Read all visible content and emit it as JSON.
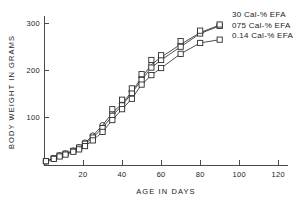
{
  "chart_data": {
    "type": "line",
    "title": "",
    "xlabel": "AGE IN DAYS",
    "ylabel": "BODY WEIGHT IN GRAMS",
    "xlim": [
      0,
      125
    ],
    "ylim": [
      0,
      315
    ],
    "xticks": [
      20,
      40,
      60,
      80,
      100,
      120
    ],
    "yticks": [
      100,
      200,
      300
    ],
    "grid": false,
    "legend_position": "top-right",
    "series": [
      {
        "name": "30 Cal-% EFA",
        "marker": "circle",
        "x": [
          1,
          5,
          8,
          11,
          15,
          18,
          21,
          25,
          30,
          35,
          40,
          45,
          50,
          55,
          60,
          70,
          80,
          90
        ],
        "y": [
          8,
          14,
          20,
          24,
          30,
          37,
          47,
          62,
          84,
          110,
          130,
          155,
          185,
          212,
          228,
          255,
          280,
          296
        ]
      },
      {
        "name": "075 Cal-% EFA",
        "marker": "square",
        "x": [
          1,
          5,
          8,
          11,
          15,
          18,
          21,
          25,
          30,
          35,
          40,
          45,
          50,
          55,
          60,
          70,
          80,
          90
        ],
        "y": [
          8,
          14,
          20,
          24,
          30,
          37,
          45,
          58,
          78,
          104,
          126,
          152,
          180,
          206,
          222,
          250,
          278,
          294
        ]
      },
      {
        "name": "0.14 Cal-% EFA",
        "marker": "square",
        "x": [
          1,
          5,
          8,
          11,
          15,
          18,
          21,
          25,
          30,
          35,
          40,
          45,
          50,
          55,
          60,
          70,
          80,
          90
        ],
        "y": [
          8,
          13,
          18,
          22,
          28,
          33,
          40,
          52,
          70,
          95,
          118,
          140,
          170,
          190,
          205,
          235,
          258,
          265
        ]
      }
    ],
    "overlay_series": [
      {
        "name": "30 Cal-% EFA upper squares",
        "marker": "square",
        "x": [
          35,
          40,
          45,
          50,
          55,
          60,
          70,
          80,
          90
        ],
        "y": [
          118,
          138,
          162,
          192,
          222,
          232,
          262,
          284,
          297
        ]
      }
    ]
  },
  "legend": {
    "entries": [
      {
        "label": "30 Cal-% EFA",
        "marker": "circle"
      },
      {
        "label": "075 Cal-% EFA",
        "marker": "circle"
      },
      {
        "label": "0.14 Cal-% EFA",
        "marker": "square"
      }
    ]
  },
  "axis": {
    "x_title": "AGE IN DAYS",
    "y_title": "BODY WEIGHT IN GRAMS",
    "x_tick_labels": [
      "20",
      "40",
      "60",
      "80",
      "100",
      "120"
    ],
    "y_tick_labels": [
      "100",
      "200",
      "300"
    ]
  },
  "colors": {
    "ink": "#2b2b2b",
    "axis": "#4a4a4a",
    "background": "#ffffff"
  }
}
